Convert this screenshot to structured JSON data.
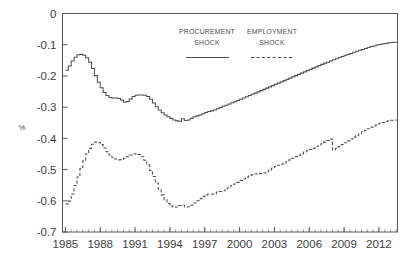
{
  "chart_data": {
    "type": "line",
    "title": "",
    "subtitle": "",
    "xlabel": "",
    "ylabel": "%",
    "xlim": [
      1984.75,
      2013.6
    ],
    "ylim": [
      -0.7,
      0.0
    ],
    "grid": false,
    "legend_position": "top-center",
    "y_ticks": [
      "0",
      "-0.1",
      "-0.2",
      "-0.3",
      "-0.4",
      "-0.5",
      "-0.6",
      "-0.7"
    ],
    "y_tick_values": [
      0,
      -0.1,
      -0.2,
      -0.3,
      -0.4,
      -0.5,
      -0.6,
      -0.7
    ],
    "x_ticks": [
      "1985",
      "1988",
      "1991",
      "1994",
      "1997",
      "2000",
      "2003",
      "2006",
      "2009",
      "2012"
    ],
    "x_tick_values": [
      1985,
      1988,
      1991,
      1994,
      1997,
      2000,
      2003,
      2006,
      2009,
      2012
    ],
    "x_minor_tick_step": 0.5,
    "series": [
      {
        "name": "PROCUREMENT SHOCK",
        "style": "solid",
        "color": "#4d4d4d",
        "x": [
          1985.0,
          1985.25,
          1985.5,
          1985.75,
          1986.0,
          1986.25,
          1986.5,
          1986.75,
          1987.0,
          1987.25,
          1987.5,
          1987.75,
          1988.0,
          1988.25,
          1988.5,
          1988.75,
          1989.0,
          1989.25,
          1989.5,
          1989.75,
          1990.0,
          1990.25,
          1990.5,
          1990.75,
          1991.0,
          1991.25,
          1991.5,
          1991.75,
          1992.0,
          1992.25,
          1992.5,
          1992.75,
          1993.0,
          1993.25,
          1993.5,
          1993.75,
          1994.0,
          1994.25,
          1994.5,
          1994.75,
          1995.0,
          1995.25,
          1995.5,
          1995.75,
          1996.0,
          1996.25,
          1996.5,
          1996.75,
          1997.0,
          1997.25,
          1997.5,
          1997.75,
          1998.0,
          1998.25,
          1998.5,
          1998.75,
          1999.0,
          1999.25,
          1999.5,
          1999.75,
          2000.0,
          2000.25,
          2000.5,
          2000.75,
          2001.0,
          2001.25,
          2001.5,
          2001.75,
          2002.0,
          2002.25,
          2002.5,
          2002.75,
          2003.0,
          2003.25,
          2003.5,
          2003.75,
          2004.0,
          2004.25,
          2004.5,
          2004.75,
          2005.0,
          2005.25,
          2005.5,
          2005.75,
          2006.0,
          2006.25,
          2006.5,
          2006.75,
          2007.0,
          2007.25,
          2007.5,
          2007.75,
          2008.0,
          2008.25,
          2008.5,
          2008.75,
          2009.0,
          2009.25,
          2009.5,
          2009.75,
          2010.0,
          2010.25,
          2010.5,
          2010.75,
          2011.0,
          2011.25,
          2011.5,
          2011.75,
          2012.0,
          2012.25,
          2012.5,
          2012.75,
          2013.0,
          2013.25,
          2013.5
        ],
        "y": [
          -0.182,
          -0.168,
          -0.152,
          -0.14,
          -0.132,
          -0.131,
          -0.134,
          -0.142,
          -0.156,
          -0.176,
          -0.199,
          -0.22,
          -0.238,
          -0.253,
          -0.263,
          -0.269,
          -0.271,
          -0.271,
          -0.272,
          -0.277,
          -0.284,
          -0.282,
          -0.274,
          -0.266,
          -0.262,
          -0.261,
          -0.261,
          -0.262,
          -0.266,
          -0.275,
          -0.287,
          -0.299,
          -0.309,
          -0.318,
          -0.325,
          -0.331,
          -0.336,
          -0.341,
          -0.344,
          -0.345,
          -0.337,
          -0.343,
          -0.341,
          -0.336,
          -0.331,
          -0.328,
          -0.325,
          -0.321,
          -0.317,
          -0.314,
          -0.312,
          -0.309,
          -0.305,
          -0.301,
          -0.297,
          -0.294,
          -0.29,
          -0.286,
          -0.283,
          -0.279,
          -0.275,
          -0.271,
          -0.267,
          -0.263,
          -0.259,
          -0.255,
          -0.251,
          -0.247,
          -0.243,
          -0.239,
          -0.235,
          -0.231,
          -0.227,
          -0.223,
          -0.219,
          -0.215,
          -0.211,
          -0.207,
          -0.203,
          -0.199,
          -0.195,
          -0.191,
          -0.187,
          -0.183,
          -0.179,
          -0.175,
          -0.171,
          -0.167,
          -0.163,
          -0.159,
          -0.156,
          -0.152,
          -0.148,
          -0.145,
          -0.141,
          -0.138,
          -0.134,
          -0.131,
          -0.128,
          -0.124,
          -0.121,
          -0.118,
          -0.115,
          -0.112,
          -0.109,
          -0.106,
          -0.104,
          -0.101,
          -0.099,
          -0.097,
          -0.096,
          -0.094,
          -0.093,
          -0.092,
          -0.091
        ]
      },
      {
        "name": "EMPLOYMENT SHOCK",
        "style": "dashed",
        "color": "#4d4d4d",
        "x": [
          1985.0,
          1985.25,
          1985.5,
          1985.75,
          1986.0,
          1986.25,
          1986.5,
          1986.75,
          1987.0,
          1987.25,
          1987.5,
          1987.75,
          1988.0,
          1988.25,
          1988.5,
          1988.75,
          1989.0,
          1989.25,
          1989.5,
          1989.75,
          1990.0,
          1990.25,
          1990.5,
          1990.75,
          1991.0,
          1991.25,
          1991.5,
          1991.75,
          1992.0,
          1992.25,
          1992.5,
          1992.75,
          1993.0,
          1993.25,
          1993.5,
          1993.75,
          1994.0,
          1994.25,
          1994.5,
          1994.75,
          1995.0,
          1995.25,
          1995.5,
          1995.75,
          1996.0,
          1996.25,
          1996.5,
          1996.75,
          1997.0,
          1997.25,
          1997.5,
          1997.75,
          1998.0,
          1998.25,
          1998.5,
          1998.75,
          1999.0,
          1999.25,
          1999.5,
          1999.75,
          2000.0,
          2000.25,
          2000.5,
          2000.75,
          2001.0,
          2001.25,
          2001.5,
          2001.75,
          2002.0,
          2002.25,
          2002.5,
          2002.75,
          2003.0,
          2003.25,
          2003.5,
          2003.75,
          2004.0,
          2004.25,
          2004.5,
          2004.75,
          2005.0,
          2005.25,
          2005.5,
          2005.75,
          2006.0,
          2006.25,
          2006.5,
          2006.75,
          2007.0,
          2007.25,
          2007.5,
          2007.75,
          2008.0,
          2008.25,
          2008.5,
          2008.75,
          2009.0,
          2009.25,
          2009.5,
          2009.75,
          2010.0,
          2010.25,
          2010.5,
          2010.75,
          2011.0,
          2011.25,
          2011.5,
          2011.75,
          2012.0,
          2012.25,
          2012.5,
          2012.75,
          2013.0,
          2013.25,
          2013.5
        ],
        "y": [
          -0.61,
          -0.601,
          -0.578,
          -0.551,
          -0.524,
          -0.497,
          -0.472,
          -0.45,
          -0.432,
          -0.419,
          -0.412,
          -0.413,
          -0.42,
          -0.431,
          -0.443,
          -0.453,
          -0.461,
          -0.466,
          -0.469,
          -0.468,
          -0.464,
          -0.459,
          -0.453,
          -0.45,
          -0.449,
          -0.452,
          -0.459,
          -0.47,
          -0.485,
          -0.503,
          -0.522,
          -0.543,
          -0.563,
          -0.581,
          -0.597,
          -0.609,
          -0.617,
          -0.621,
          -0.62,
          -0.615,
          -0.614,
          -0.62,
          -0.619,
          -0.614,
          -0.607,
          -0.6,
          -0.593,
          -0.586,
          -0.581,
          -0.579,
          -0.579,
          -0.578,
          -0.572,
          -0.57,
          -0.568,
          -0.561,
          -0.556,
          -0.551,
          -0.546,
          -0.541,
          -0.535,
          -0.53,
          -0.525,
          -0.521,
          -0.517,
          -0.514,
          -0.512,
          -0.513,
          -0.511,
          -0.507,
          -0.502,
          -0.496,
          -0.49,
          -0.486,
          -0.483,
          -0.479,
          -0.474,
          -0.469,
          -0.464,
          -0.459,
          -0.454,
          -0.449,
          -0.444,
          -0.44,
          -0.436,
          -0.432,
          -0.427,
          -0.422,
          -0.417,
          -0.412,
          -0.407,
          -0.402,
          -0.437,
          -0.432,
          -0.426,
          -0.42,
          -0.414,
          -0.408,
          -0.402,
          -0.396,
          -0.391,
          -0.385,
          -0.379,
          -0.374,
          -0.369,
          -0.364,
          -0.36,
          -0.356,
          -0.352,
          -0.349,
          -0.346,
          -0.344,
          -0.342,
          -0.341,
          -0.34
        ]
      }
    ],
    "annotations": []
  },
  "legend": {
    "entries": [
      {
        "line1": "PROCUREMENT",
        "line2": "SHOCK",
        "style": "solid"
      },
      {
        "line1": "EMPLOYMENT",
        "line2": "SHOCK",
        "style": "dashed"
      }
    ]
  }
}
